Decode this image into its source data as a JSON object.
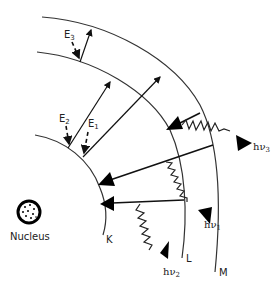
{
  "diagram": {
    "title": "",
    "nucleus_label": "Nucleus",
    "shells": {
      "k": "K",
      "l": "L",
      "m": "M"
    },
    "energies": {
      "e1": {
        "base": "E",
        "sub": "1"
      },
      "e2": {
        "base": "E",
        "sub": "2"
      },
      "e3": {
        "base": "E",
        "sub": "3"
      }
    },
    "photons": {
      "hv1": {
        "base": "hν",
        "sub": "1"
      },
      "hv2": {
        "base": "hν",
        "sub": "2"
      },
      "hv3": {
        "base": "hν",
        "sub": "3"
      }
    },
    "colors": {
      "line": "#111111",
      "background": "#ffffff"
    }
  }
}
